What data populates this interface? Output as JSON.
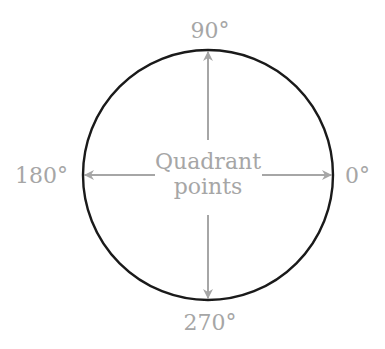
{
  "diagram": {
    "center_label_line1": "Quadrant",
    "center_label_line2": "points",
    "labels": {
      "top": "90°",
      "left": "180°",
      "right": "0°",
      "bottom": "270°"
    },
    "colors": {
      "circle": "#1a1a1a",
      "arrows": "#a6a6a6",
      "text": "#a6a6a6"
    }
  }
}
